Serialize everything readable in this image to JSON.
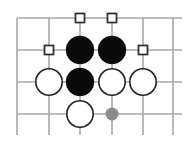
{
  "diagram": {
    "colors": {
      "grid": "#a8a8a8",
      "black_stone": "#0a0a0a",
      "white_stone_fill": "#ffffff",
      "white_stone_stroke": "#222222",
      "marker": "#333333",
      "grey_point": "#8c8c8c"
    },
    "grid": {
      "columns_x": [
        17,
        49,
        80,
        112,
        143,
        173
      ],
      "rows_y": [
        18,
        50,
        82,
        114
      ],
      "vertical_end_y": 135,
      "horizontal_end_x": 182,
      "top_edge": true,
      "left_edge": true
    },
    "stones": [
      {
        "color": "black",
        "col": 2,
        "row": 1
      },
      {
        "color": "black",
        "col": 3,
        "row": 1
      },
      {
        "color": "black",
        "col": 2,
        "row": 2
      },
      {
        "color": "white",
        "col": 1,
        "row": 2
      },
      {
        "color": "white",
        "col": 3,
        "row": 2
      },
      {
        "color": "white",
        "col": 4,
        "row": 2
      },
      {
        "color": "white",
        "col": 2,
        "row": 3
      }
    ],
    "markers": [
      {
        "type": "square",
        "col": 2,
        "row": 0
      },
      {
        "type": "square",
        "col": 3,
        "row": 0
      },
      {
        "type": "square",
        "col": 1,
        "row": 1
      },
      {
        "type": "square",
        "col": 4,
        "row": 1
      }
    ],
    "points": [
      {
        "type": "grey-dot",
        "col": 3,
        "row": 3
      }
    ]
  }
}
